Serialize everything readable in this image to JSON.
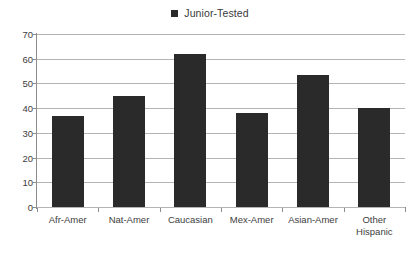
{
  "chart_data": {
    "type": "bar",
    "title": "",
    "subtitle": "",
    "xlabel": "",
    "ylabel": "",
    "categories": [
      "Afr-Amer",
      "Nat-Amer",
      "Caucasian",
      "Mex-Amer",
      "Asian-Amer",
      "Other\nHispanic"
    ],
    "series": [
      {
        "name": "Junior-Tested",
        "values": [
          37,
          45,
          62,
          38,
          53.5,
          40
        ],
        "color": "#2a2a2a"
      }
    ],
    "ylim": [
      0,
      70
    ],
    "yticks": [
      0,
      10,
      20,
      30,
      40,
      50,
      60,
      70
    ],
    "ytick_labels": [
      "0",
      "10",
      "20",
      "30",
      "40",
      "50",
      "60",
      "70"
    ],
    "grid": true,
    "grid_axis": "y",
    "legend": {
      "position": "top-center",
      "entries": [
        {
          "label": "Junior-Tested",
          "marker": "square",
          "color": "#2a2a2a"
        }
      ]
    },
    "annotations": [],
    "background_color": "#ffffff",
    "axis_color": "#8c8c8c",
    "gridline_color": "#b4b4b4"
  }
}
